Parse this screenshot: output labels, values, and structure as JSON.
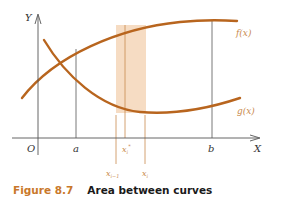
{
  "figure": {
    "number_label": "Figure 8.7",
    "title": "Area between curves",
    "axes": {
      "x_label": "X",
      "y_label": "Y",
      "origin_label": "O"
    },
    "curves": [
      {
        "name": "f(x)",
        "label": "f(x)",
        "color": "#b8651e"
      },
      {
        "name": "g(x)",
        "label": "g(x)",
        "color": "#b8651e"
      }
    ],
    "x_markers": {
      "a": "a",
      "b": "b",
      "x_prev": "x",
      "x_prev_sub": "i−1",
      "x_star": "x",
      "x_star_sub": "i",
      "x_star_sup": "*",
      "x_i": "x",
      "x_i_sub": "i"
    },
    "colors": {
      "curve": "#b8651e",
      "strip": "#f6dcc3",
      "axis": "#555555",
      "caption_accent": "#c9782b"
    }
  }
}
